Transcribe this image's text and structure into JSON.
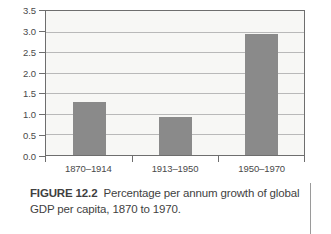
{
  "chart_data": {
    "type": "bar",
    "title": "",
    "categories": [
      "1870–1914",
      "1913–1950",
      "1950–1970"
    ],
    "values": [
      1.3,
      0.92,
      2.93
    ],
    "xlabel": "",
    "ylabel": "",
    "ylim": [
      0.0,
      3.5
    ],
    "yticks": [
      "0.0",
      "0.5",
      "1.0",
      "1.5",
      "2.0",
      "2.5",
      "3.0",
      "3.5"
    ],
    "ytick_values": [
      0.0,
      0.5,
      1.0,
      1.5,
      2.0,
      2.5,
      3.0,
      3.5
    ],
    "grid": true,
    "legend": "none",
    "bar_color": "#8a8a8a",
    "plot_background": "#f7f7f5",
    "gridline_color": "#b9b9b9",
    "axis_color": "#6e6e6e"
  },
  "caption": {
    "figure_number": "FIGURE 12.2",
    "text": "Percentage per annum growth of global GDP per capita, 1870 to 1970."
  }
}
